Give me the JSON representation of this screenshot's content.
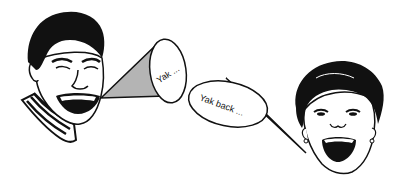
{
  "scene": {
    "description": "Line-art illustration of two people talking",
    "colors": {
      "ink": "#111111",
      "cone_fill": "#b4b4b4",
      "background": "#ffffff"
    }
  },
  "speaker_left": {
    "label": "man-laughing",
    "bubble_text": "Yak ..."
  },
  "speaker_right": {
    "label": "woman-laughing",
    "bubble_text": "Yak back ..."
  }
}
